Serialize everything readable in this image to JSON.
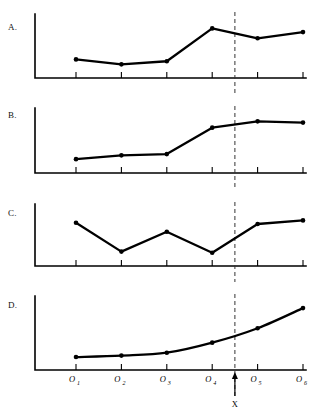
{
  "figure": {
    "title": "",
    "x_marker_label": "X",
    "x_marker_position_between": [
      "O3",
      "O4"
    ],
    "tick_labels": [
      {
        "base": "O",
        "sub": "1"
      },
      {
        "base": "O",
        "sub": "2"
      },
      {
        "base": "O",
        "sub": "3"
      },
      {
        "base": "O",
        "sub": "4"
      },
      {
        "base": "O",
        "sub": "5"
      },
      {
        "base": "O",
        "sub": "6"
      }
    ],
    "colors": {
      "line": "#000000",
      "axis": "#000000",
      "dashed_intervention": "#333333",
      "background": "#ffffff"
    }
  },
  "panels": [
    {
      "id": "A",
      "label": "A."
    },
    {
      "id": "B",
      "label": "B."
    },
    {
      "id": "C",
      "label": "C."
    },
    {
      "id": "D",
      "label": "D."
    }
  ],
  "chart_data": [
    {
      "type": "line",
      "panel": "A",
      "title": "A.",
      "xlabel": "",
      "ylabel": "",
      "categories": [
        "O1",
        "O2",
        "O3",
        "O4",
        "O5",
        "O6"
      ],
      "values": [
        30,
        22,
        27,
        80,
        64,
        74
      ],
      "ylim": [
        0,
        100
      ],
      "grid": false,
      "legend": "none",
      "annotations": [
        {
          "type": "vline",
          "label": "X",
          "between": [
            "O3",
            "O4"
          ],
          "style": "dashed"
        }
      ],
      "markers": true,
      "shape": "stable-then-abrupt-level-increase"
    },
    {
      "type": "line",
      "panel": "B",
      "title": "B.",
      "xlabel": "",
      "ylabel": "",
      "categories": [
        "O1",
        "O2",
        "O3",
        "O4",
        "O5",
        "O6"
      ],
      "values": [
        22,
        28,
        30,
        72,
        82,
        80
      ],
      "ylim": [
        0,
        100
      ],
      "grid": false,
      "legend": "none",
      "annotations": [
        {
          "type": "vline",
          "label": "X",
          "between": [
            "O3",
            "O4"
          ],
          "style": "dashed"
        }
      ],
      "markers": true,
      "shape": "flat-then-rise-then-plateau"
    },
    {
      "type": "line",
      "panel": "C",
      "title": "C.",
      "xlabel": "",
      "ylabel": "",
      "categories": [
        "O1",
        "O2",
        "O3",
        "O4",
        "O5",
        "O6"
      ],
      "values": [
        72,
        24,
        57,
        22,
        70,
        76
      ],
      "ylim": [
        0,
        100
      ],
      "grid": false,
      "legend": "none",
      "annotations": [
        {
          "type": "vline",
          "label": "X",
          "between": [
            "O3",
            "O4"
          ],
          "style": "dashed"
        }
      ],
      "markers": true,
      "shape": "unstable-zigzag-no-clear-effect"
    },
    {
      "type": "line",
      "panel": "D",
      "title": "D.",
      "xlabel": "",
      "ylabel": "",
      "categories": [
        "O1",
        "O2",
        "O3",
        "O4",
        "O5",
        "O6"
      ],
      "values": [
        18,
        20,
        24,
        38,
        58,
        86
      ],
      "ylim": [
        0,
        100
      ],
      "grid": false,
      "legend": "none",
      "annotations": [
        {
          "type": "vline",
          "label": "X",
          "between": [
            "O3",
            "O4"
          ],
          "style": "dashed"
        }
      ],
      "markers": true,
      "shape": "smooth-accelerating-upward-trend"
    }
  ]
}
